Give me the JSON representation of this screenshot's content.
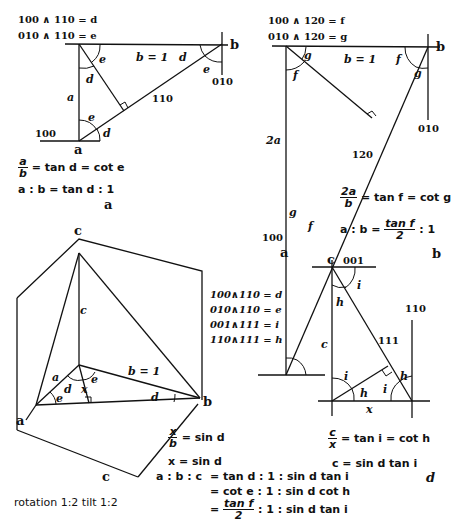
{
  "panel_a": {
    "caption": "a",
    "def1": "100 ∧ 110 = d",
    "def2": "010 ∧ 110 = e",
    "b_label": "b = 1",
    "a_label": "a",
    "face_110": "110",
    "face_100": "100",
    "face_010": "010",
    "corner_a": "a",
    "corner_b": "b",
    "angle_d": "d",
    "angle_e": "e",
    "eq1_num": "a",
    "eq1_den": "b",
    "eq1_rest": "= tan d = cot e",
    "eq2": "a : b = tan d : 1"
  },
  "panel_b": {
    "caption": "b",
    "def1": "100 ∧ 120 = f",
    "def2": "010 ∧ 120 = g",
    "b_label": "b = 1",
    "a_label": "2a",
    "face_120": "120",
    "face_100": "100",
    "face_010": "010",
    "corner_a": "a",
    "corner_b": "b",
    "angle_f": "f",
    "angle_g": "g",
    "eq1_num": "2a",
    "eq1_den": "b",
    "eq1_rest": "= tan f = cot g",
    "eq2_left": "a : b =",
    "eq2_num": "tan f",
    "eq2_den": "2",
    "eq2_right": ": 1"
  },
  "panel_c": {
    "caption": "c",
    "corner_c": "c",
    "corner_a": "a",
    "corner_b": "b",
    "c_label": "c",
    "a_label": "a",
    "b_label": "b = 1",
    "x_label": "x",
    "angle_d": "d",
    "angle_e": "e",
    "defs": [
      "100∧110 = d",
      "010∧110 = e",
      "001∧111 = i",
      "110∧111 = h"
    ],
    "eq1_num": "x",
    "eq1_den": "b",
    "eq1_rest": "= sin d",
    "eq2": "x = sin d",
    "note": "rotation 1:2  tilt 1:2"
  },
  "panel_d": {
    "caption": "d",
    "corner_c": "c",
    "face_001": "001",
    "face_110": "110",
    "face_111": "111",
    "c_label": "c",
    "x_label": "x",
    "angle_i": "i",
    "angle_h": "h",
    "eq1_num": "c",
    "eq1_den": "x",
    "eq1_rest": "= tan i = cot h",
    "eq2": "c = sin d tan i"
  },
  "summary": {
    "lhs": "a : b : c",
    "row1": "= tan d  : 1 : sin d tan i",
    "row2": "= cot e  : 1 : sin d cot h",
    "row3_eq": "=",
    "row3_num": "tan f",
    "row3_den": "2",
    "row3_rest": ": 1 : sin d tan i"
  }
}
